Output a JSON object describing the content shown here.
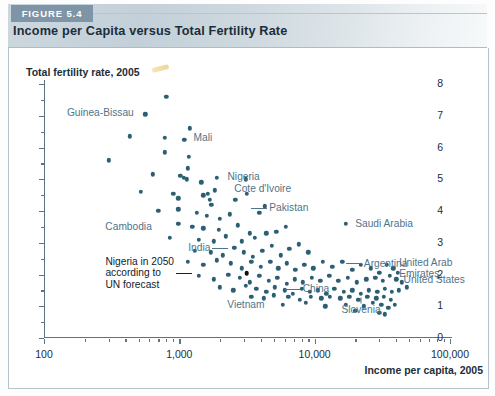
{
  "header": {
    "badge": "FIGURE 5.4",
    "title": "Income per Capita versus Total Fertility Rate"
  },
  "chart_data": {
    "type": "scatter",
    "title": "Income per Capita versus Total Fertility Rate",
    "xlabel": "Income per capita, 2005",
    "ylabel": "Total fertility rate, 2005",
    "xscale": "log",
    "yscale": "linear",
    "xlim": [
      100,
      100000
    ],
    "ylim": [
      0,
      8
    ],
    "grid": false,
    "legend": null,
    "x_ticks": [
      100,
      1000,
      10000,
      100000
    ],
    "x_tick_labels": [
      "100",
      "1,000",
      "10,000",
      "100,000"
    ],
    "y_ticks": [
      0,
      1,
      2,
      3,
      4,
      5,
      6,
      7,
      8
    ],
    "y_tick_labels": [
      "0",
      "1",
      "2",
      "3",
      "4",
      "5",
      "6",
      "7",
      "8"
    ],
    "y_minor_step": 0.5,
    "point_color": "#2d5f73",
    "highlight_color": "#111111",
    "label_color": "#50748a",
    "annotations": [
      {
        "text": "Guinea-Bissau",
        "x": 520,
        "y": 7.1,
        "align": "right",
        "leader": false
      },
      {
        "text": "Mali",
        "x": 1150,
        "y": 6.3,
        "align": "left",
        "leader": false
      },
      {
        "text": "Nigeria",
        "x": 2050,
        "y": 5.1,
        "align": "left",
        "leader": false
      },
      {
        "text": "Cote d'Ivoire",
        "x": 2300,
        "y": 4.7,
        "align": "left",
        "leader": false
      },
      {
        "text": "Cambodia",
        "x": 700,
        "y": 3.5,
        "align": "right",
        "leader": false
      },
      {
        "text": "Pakistan",
        "x": 3400,
        "y": 4.1,
        "align": "left",
        "leader": true
      },
      {
        "text": "Saudi Arabia",
        "x": 18000,
        "y": 3.6,
        "align": "left",
        "leader": false
      },
      {
        "text": "India",
        "x": 2300,
        "y": 2.85,
        "align": "right",
        "leader": true
      },
      {
        "text": "Argentina",
        "x": 17000,
        "y": 2.35,
        "align": "left",
        "leader": true
      },
      {
        "text": "United Arab\nEmirates",
        "x": 38000,
        "y": 2.2,
        "align": "left",
        "leader": false
      },
      {
        "text": "United States",
        "x": 41000,
        "y": 1.85,
        "align": "left",
        "leader": false
      },
      {
        "text": "China",
        "x": 6000,
        "y": 1.55,
        "align": "left",
        "leader": true
      },
      {
        "text": "Vietnam",
        "x": 3100,
        "y": 1.05,
        "align": "center",
        "leader": false
      },
      {
        "text": "Slovenia",
        "x": 22000,
        "y": 0.9,
        "align": "center",
        "leader": true
      },
      {
        "text": "Nigeria in 2050\naccording to\nUN forecast",
        "x": 1250,
        "y": 2.05,
        "align": "right",
        "leader": true,
        "dark": true
      }
    ],
    "points": [
      {
        "x": 800,
        "y": 7.6
      },
      {
        "x": 560,
        "y": 7.05
      },
      {
        "x": 1200,
        "y": 6.6
      },
      {
        "x": 430,
        "y": 6.35
      },
      {
        "x": 780,
        "y": 6.3
      },
      {
        "x": 1090,
        "y": 6.25
      },
      {
        "x": 780,
        "y": 5.85
      },
      {
        "x": 1180,
        "y": 5.7
      },
      {
        "x": 1150,
        "y": 5.35
      },
      {
        "x": 300,
        "y": 5.6
      },
      {
        "x": 640,
        "y": 5.15
      },
      {
        "x": 1020,
        "y": 5.1
      },
      {
        "x": 1080,
        "y": 5.05
      },
      {
        "x": 1140,
        "y": 5.0
      },
      {
        "x": 1450,
        "y": 4.9
      },
      {
        "x": 1900,
        "y": 5.05
      },
      {
        "x": 3100,
        "y": 5.0
      },
      {
        "x": 520,
        "y": 4.6
      },
      {
        "x": 900,
        "y": 4.55
      },
      {
        "x": 980,
        "y": 4.4
      },
      {
        "x": 1500,
        "y": 4.5
      },
      {
        "x": 1620,
        "y": 4.55
      },
      {
        "x": 1680,
        "y": 4.35
      },
      {
        "x": 1720,
        "y": 4.2
      },
      {
        "x": 1830,
        "y": 4.65
      },
      {
        "x": 2600,
        "y": 4.35
      },
      {
        "x": 3150,
        "y": 4.55
      },
      {
        "x": 700,
        "y": 4.0
      },
      {
        "x": 980,
        "y": 4.05
      },
      {
        "x": 1350,
        "y": 3.95
      },
      {
        "x": 1600,
        "y": 3.85
      },
      {
        "x": 2000,
        "y": 3.75
      },
      {
        "x": 2350,
        "y": 3.9
      },
      {
        "x": 980,
        "y": 3.6
      },
      {
        "x": 1250,
        "y": 3.5
      },
      {
        "x": 1500,
        "y": 3.45
      },
      {
        "x": 1950,
        "y": 3.4
      },
      {
        "x": 2700,
        "y": 3.55
      },
      {
        "x": 3300,
        "y": 3.3
      },
      {
        "x": 3900,
        "y": 3.95
      },
      {
        "x": 4300,
        "y": 4.15
      },
      {
        "x": 17000,
        "y": 3.6
      },
      {
        "x": 850,
        "y": 3.15
      },
      {
        "x": 1400,
        "y": 3.1
      },
      {
        "x": 1800,
        "y": 3.05
      },
      {
        "x": 2200,
        "y": 3.2
      },
      {
        "x": 2900,
        "y": 3.05
      },
      {
        "x": 3600,
        "y": 3.15
      },
      {
        "x": 4400,
        "y": 3.3
      },
      {
        "x": 5200,
        "y": 3.35
      },
      {
        "x": 6100,
        "y": 3.5
      },
      {
        "x": 1300,
        "y": 2.75
      },
      {
        "x": 1700,
        "y": 2.7
      },
      {
        "x": 2100,
        "y": 2.6
      },
      {
        "x": 2550,
        "y": 2.85
      },
      {
        "x": 3000,
        "y": 2.7
      },
      {
        "x": 3500,
        "y": 2.55
      },
      {
        "x": 4100,
        "y": 2.75
      },
      {
        "x": 4800,
        "y": 2.9
      },
      {
        "x": 5600,
        "y": 2.6
      },
      {
        "x": 6500,
        "y": 2.8
      },
      {
        "x": 7600,
        "y": 2.95
      },
      {
        "x": 9000,
        "y": 2.7
      },
      {
        "x": 1150,
        "y": 2.4
      },
      {
        "x": 1500,
        "y": 2.3
      },
      {
        "x": 1900,
        "y": 2.45
      },
      {
        "x": 2400,
        "y": 2.35
      },
      {
        "x": 2900,
        "y": 2.2
      },
      {
        "x": 3400,
        "y": 2.4
      },
      {
        "x": 4000,
        "y": 2.25
      },
      {
        "x": 4700,
        "y": 2.4
      },
      {
        "x": 5400,
        "y": 2.2
      },
      {
        "x": 6200,
        "y": 2.35
      },
      {
        "x": 7200,
        "y": 2.15
      },
      {
        "x": 8400,
        "y": 2.3
      },
      {
        "x": 9800,
        "y": 2.2
      },
      {
        "x": 11500,
        "y": 2.4
      },
      {
        "x": 13500,
        "y": 2.25
      },
      {
        "x": 16000,
        "y": 2.4
      },
      {
        "x": 19000,
        "y": 2.15
      },
      {
        "x": 22000,
        "y": 2.3
      },
      {
        "x": 26000,
        "y": 2.2
      },
      {
        "x": 30000,
        "y": 2.05
      },
      {
        "x": 34000,
        "y": 2.3
      },
      {
        "x": 38000,
        "y": 2.2
      },
      {
        "x": 41000,
        "y": 2.05
      },
      {
        "x": 1400,
        "y": 1.95
      },
      {
        "x": 1800,
        "y": 1.85
      },
      {
        "x": 2300,
        "y": 2.0
      },
      {
        "x": 2800,
        "y": 1.9
      },
      {
        "x": 3300,
        "y": 1.75
      },
      {
        "x": 3900,
        "y": 1.95
      },
      {
        "x": 4600,
        "y": 1.8
      },
      {
        "x": 5300,
        "y": 1.9
      },
      {
        "x": 6200,
        "y": 1.7
      },
      {
        "x": 7100,
        "y": 1.85
      },
      {
        "x": 8200,
        "y": 1.75
      },
      {
        "x": 9500,
        "y": 1.9
      },
      {
        "x": 11000,
        "y": 1.8
      },
      {
        "x": 12800,
        "y": 1.95
      },
      {
        "x": 15000,
        "y": 1.8
      },
      {
        "x": 17500,
        "y": 1.9
      },
      {
        "x": 20500,
        "y": 1.75
      },
      {
        "x": 24000,
        "y": 1.85
      },
      {
        "x": 28000,
        "y": 1.9
      },
      {
        "x": 32000,
        "y": 1.8
      },
      {
        "x": 36000,
        "y": 1.95
      },
      {
        "x": 40000,
        "y": 1.85
      },
      {
        "x": 44000,
        "y": 1.75
      },
      {
        "x": 2000,
        "y": 1.6
      },
      {
        "x": 2500,
        "y": 1.5
      },
      {
        "x": 3100,
        "y": 1.65
      },
      {
        "x": 3700,
        "y": 1.55
      },
      {
        "x": 4400,
        "y": 1.45
      },
      {
        "x": 5100,
        "y": 1.6
      },
      {
        "x": 6000,
        "y": 1.5
      },
      {
        "x": 6900,
        "y": 1.4
      },
      {
        "x": 8000,
        "y": 1.55
      },
      {
        "x": 9200,
        "y": 1.45
      },
      {
        "x": 10600,
        "y": 1.5
      },
      {
        "x": 12200,
        "y": 1.4
      },
      {
        "x": 14000,
        "y": 1.55
      },
      {
        "x": 16500,
        "y": 1.45
      },
      {
        "x": 19000,
        "y": 1.5
      },
      {
        "x": 22000,
        "y": 1.4
      },
      {
        "x": 25000,
        "y": 1.5
      },
      {
        "x": 29000,
        "y": 1.45
      },
      {
        "x": 33000,
        "y": 1.55
      },
      {
        "x": 37000,
        "y": 1.45
      },
      {
        "x": 42000,
        "y": 1.5
      },
      {
        "x": 48000,
        "y": 1.6
      },
      {
        "x": 3400,
        "y": 1.3
      },
      {
        "x": 4200,
        "y": 1.25
      },
      {
        "x": 5000,
        "y": 1.35
      },
      {
        "x": 6400,
        "y": 1.3
      },
      {
        "x": 7800,
        "y": 1.2
      },
      {
        "x": 9400,
        "y": 1.3
      },
      {
        "x": 11200,
        "y": 1.25
      },
      {
        "x": 13000,
        "y": 1.3
      },
      {
        "x": 15500,
        "y": 1.25
      },
      {
        "x": 18000,
        "y": 1.3
      },
      {
        "x": 21000,
        "y": 1.2
      },
      {
        "x": 24500,
        "y": 1.3
      },
      {
        "x": 28500,
        "y": 1.25
      },
      {
        "x": 32500,
        "y": 1.3
      },
      {
        "x": 36500,
        "y": 1.2
      },
      {
        "x": 5800,
        "y": 1.05
      },
      {
        "x": 8600,
        "y": 1.1
      },
      {
        "x": 12000,
        "y": 1.0
      },
      {
        "x": 17000,
        "y": 1.05
      },
      {
        "x": 23000,
        "y": 1.0
      },
      {
        "x": 27000,
        "y": 1.1
      },
      {
        "x": 31000,
        "y": 1.05
      },
      {
        "x": 35000,
        "y": 0.95
      },
      {
        "x": 39000,
        "y": 1.05
      },
      {
        "x": 20000,
        "y": 0.85
      },
      {
        "x": 30000,
        "y": 0.8
      },
      {
        "x": 33000,
        "y": 0.75
      }
    ],
    "highlight_points": [
      {
        "x": 3150,
        "y": 2.05,
        "label": "Nigeria in 2050 according to UN forecast"
      }
    ]
  }
}
